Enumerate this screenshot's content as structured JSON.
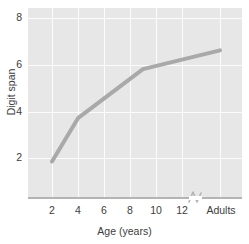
{
  "chart_data": {
    "type": "line",
    "title": "",
    "xlabel": "Age (years)",
    "ylabel": "Digit span",
    "x_tick_labels": [
      "2",
      "4",
      "6",
      "8",
      "10",
      "12",
      "Adults"
    ],
    "y_tick_labels": [
      "2",
      "4",
      "6",
      "8"
    ],
    "x_tick_values": [
      2,
      4,
      6,
      8,
      10,
      12,
      15
    ],
    "y_tick_values": [
      2,
      4,
      6,
      8
    ],
    "ylim": [
      0,
      8.4
    ],
    "xlim": [
      1,
      16
    ],
    "grid": true,
    "legend": null,
    "axis_break": {
      "present": true,
      "between": [
        "12",
        "Adults"
      ],
      "style": "zigzag"
    },
    "series": [
      {
        "name": "Digit span by age",
        "color": "#a9a9a9",
        "line_width": 4,
        "x": [
          2,
          4,
          9,
          15
        ],
        "x_category": [
          "2",
          "4",
          "9",
          "Adults"
        ],
        "y": [
          1.85,
          3.7,
          5.8,
          6.6
        ]
      }
    ],
    "colors": {
      "plot_background": "#e7e7e7",
      "gridline": "#fbfbfb",
      "axis_line": "#b4b4b4",
      "series_line": "#a9a9a9",
      "text": "#3d3d3d",
      "figure_background": "#ffffff"
    }
  },
  "axes": {
    "y_title": "Digit span",
    "x_title": "Age (years)"
  },
  "ticks": {
    "y": [
      {
        "label": "8",
        "value": 8
      },
      {
        "label": "6",
        "value": 6
      },
      {
        "label": "4",
        "value": 4
      },
      {
        "label": "2",
        "value": 2
      }
    ],
    "x": [
      {
        "label": "2",
        "value": 2
      },
      {
        "label": "4",
        "value": 4
      },
      {
        "label": "6",
        "value": 6
      },
      {
        "label": "8",
        "value": 8
      },
      {
        "label": "10",
        "value": 10
      },
      {
        "label": "12",
        "value": 12
      },
      {
        "label": "Adults",
        "value": 15
      }
    ]
  }
}
